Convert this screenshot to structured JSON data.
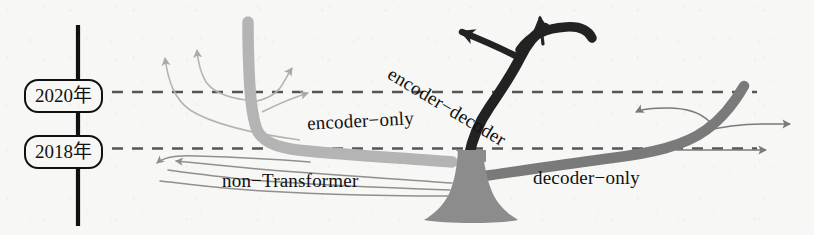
{
  "figure": {
    "type": "diagram",
    "subtype": "evolutionary-tree",
    "background_color": "#f7f7f5",
    "width": 814,
    "height": 235
  },
  "axis": {
    "name": "timeline-axis",
    "orientation": "vertical",
    "color": "#111111",
    "x": 78,
    "y_top": 25,
    "y_bottom": 225,
    "ticks": [
      {
        "label": "2020年",
        "y": 92,
        "dashed_line": true
      },
      {
        "label": "2018年",
        "y": 148,
        "dashed_line": true
      }
    ]
  },
  "gridlines": {
    "style": "dashed",
    "color": "#555555",
    "x_start": 110,
    "x_end": 760,
    "rows": [
      92,
      148
    ]
  },
  "colors": {
    "dark_branch": "#222222",
    "mid_branch": "#7a7a7a",
    "trunk": "#8c8c8c",
    "light_branch": "#b4b4b4",
    "thin_line": "#8f8f8f",
    "text": "#111111",
    "axis": "#111111",
    "dash": "#555555"
  },
  "trunk": {
    "name": "tree-trunk",
    "base_x": 470,
    "base_y": 222,
    "top_y": 152,
    "color": "#8c8c8c"
  },
  "branches": [
    {
      "id": "non-transformer",
      "label": "non−Transformer",
      "label_x": 222,
      "label_y": 170,
      "color": "#8f8f8f",
      "weight": "thin",
      "direction": "left",
      "tip_count": 3,
      "era": "pre-2018"
    },
    {
      "id": "encoder-only",
      "label": "encoder−only",
      "label_x": 307,
      "label_y": 110,
      "color": "#b4b4b4",
      "weight": "medium",
      "direction": "left-up",
      "tip_count": 3,
      "era": "2018-2020"
    },
    {
      "id": "encoder-decoder",
      "label": "encoder−decoder",
      "label_x": 395,
      "label_y": 63,
      "rotation_deg": 31,
      "color": "#222222",
      "weight": "thick",
      "direction": "up",
      "tip_count": 2,
      "era": "2018-present"
    },
    {
      "id": "decoder-only",
      "label": "decoder−only",
      "label_x": 533,
      "label_y": 167,
      "color": "#7a7a7a",
      "weight": "medium",
      "direction": "right-up",
      "tip_count": 3,
      "era": "2018-present"
    }
  ],
  "labels": {
    "encoder_only": "encoder−only",
    "encoder_decoder": "encoder−decoder",
    "non_transformer": "non−Transformer",
    "decoder_only": "decoder−only",
    "year_2020": "2020年",
    "year_2018": "2018年"
  }
}
